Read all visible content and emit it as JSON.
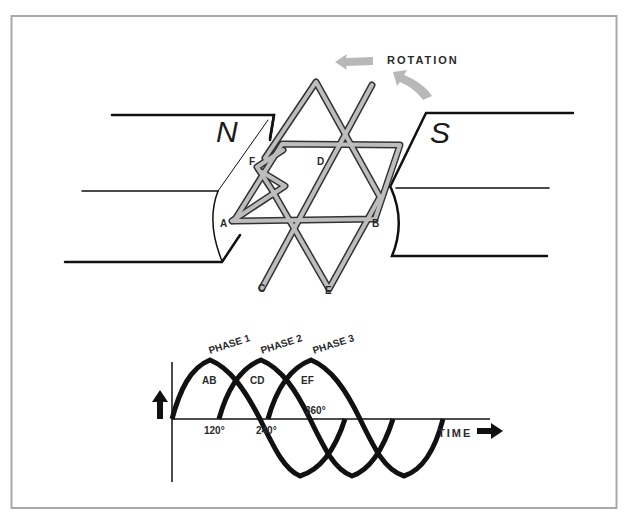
{
  "figure": {
    "colors": {
      "frame": "#a8a8a8",
      "ink": "#111111",
      "coil": "#b3b3b3",
      "rotation_arrow": "#b8b8b8"
    }
  },
  "generator": {
    "rotation_label": "ROTATION",
    "north_pole_label": "N",
    "south_pole_label": "S",
    "coil_terminals": [
      "A",
      "B",
      "C",
      "D",
      "E",
      "F"
    ]
  },
  "waveform": {
    "phase_labels": [
      "PHASE 1",
      "PHASE 2",
      "PHASE 3"
    ],
    "coil_labels": [
      "AB",
      "CD",
      "EF"
    ],
    "angle_labels": [
      "120°",
      "240°",
      "360°"
    ],
    "time_label": "TIME"
  }
}
